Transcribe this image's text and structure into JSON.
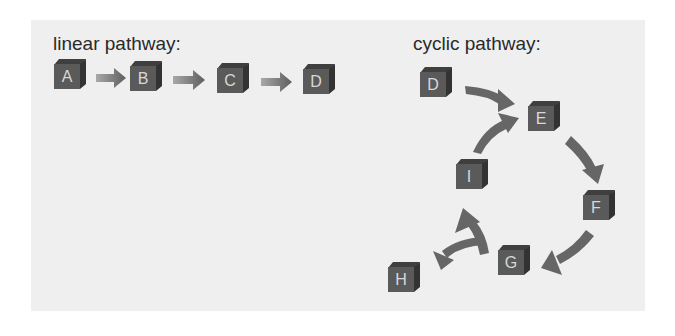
{
  "linear": {
    "title": "linear pathway:",
    "nodes": [
      {
        "label": "A",
        "x": 54,
        "y": 59
      },
      {
        "label": "B",
        "x": 130,
        "y": 61
      },
      {
        "label": "C",
        "x": 217,
        "y": 63
      },
      {
        "label": "D",
        "x": 303,
        "y": 64
      }
    ]
  },
  "cyclic": {
    "title": "cyclic pathway:",
    "nodes": [
      {
        "label": "D",
        "x": 420,
        "y": 67
      },
      {
        "label": "E",
        "x": 528,
        "y": 101
      },
      {
        "label": "F",
        "x": 583,
        "y": 190
      },
      {
        "label": "G",
        "x": 498,
        "y": 245
      },
      {
        "label": "I",
        "x": 456,
        "y": 159
      },
      {
        "label": "H",
        "x": 388,
        "y": 262
      }
    ]
  },
  "colors": {
    "panel": "#efefef",
    "cube": "#5a5a5a",
    "arrow": "#6a6a6a"
  }
}
